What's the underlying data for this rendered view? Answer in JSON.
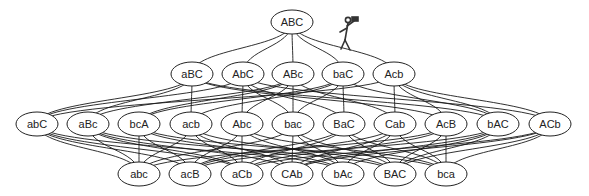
{
  "diagram": {
    "type": "lattice",
    "node_rx": 21,
    "node_ry": 12,
    "nodes": [
      {
        "id": "ABC",
        "label": "ABC",
        "x": 292,
        "y": 22
      },
      {
        "id": "aBC",
        "label": "aBC",
        "x": 192,
        "y": 74
      },
      {
        "id": "AbC",
        "label": "AbC",
        "x": 243,
        "y": 74
      },
      {
        "id": "ABc",
        "label": "ABc",
        "x": 293,
        "y": 74
      },
      {
        "id": "baC",
        "label": "baC",
        "x": 343,
        "y": 74
      },
      {
        "id": "Acb",
        "label": "Acb",
        "x": 394,
        "y": 74
      },
      {
        "id": "abC",
        "label": "abC",
        "x": 37,
        "y": 124
      },
      {
        "id": "aBc",
        "label": "aBc",
        "x": 88,
        "y": 124
      },
      {
        "id": "bcA",
        "label": "bcA",
        "x": 139,
        "y": 124
      },
      {
        "id": "acb",
        "label": "acb",
        "x": 191,
        "y": 124
      },
      {
        "id": "Abc",
        "label": "Abc",
        "x": 242,
        "y": 124
      },
      {
        "id": "bac",
        "label": "bac",
        "x": 293,
        "y": 124
      },
      {
        "id": "BaC",
        "label": "BaC",
        "x": 344,
        "y": 124
      },
      {
        "id": "Cab",
        "label": "Cab",
        "x": 395,
        "y": 124
      },
      {
        "id": "AcB",
        "label": "AcB",
        "x": 446,
        "y": 124
      },
      {
        "id": "bAC",
        "label": "bAC",
        "x": 498,
        "y": 124
      },
      {
        "id": "ACb",
        "label": "ACb",
        "x": 550,
        "y": 124
      },
      {
        "id": "abc",
        "label": "abc",
        "x": 139,
        "y": 174
      },
      {
        "id": "acB",
        "label": "acB",
        "x": 190,
        "y": 174
      },
      {
        "id": "aCb",
        "label": "aCb",
        "x": 242,
        "y": 174
      },
      {
        "id": "CAb",
        "label": "CAb",
        "x": 292,
        "y": 174
      },
      {
        "id": "bAc",
        "label": "bAc",
        "x": 343,
        "y": 174
      },
      {
        "id": "BAC",
        "label": "BAC",
        "x": 395,
        "y": 174
      },
      {
        "id": "bca",
        "label": "bca",
        "x": 446,
        "y": 174
      }
    ],
    "edges": [
      [
        "ABC",
        "aBC"
      ],
      [
        "ABC",
        "AbC"
      ],
      [
        "ABC",
        "ABc"
      ],
      [
        "ABC",
        "baC"
      ],
      [
        "ABC",
        "Acb"
      ],
      [
        "aBC",
        "abC"
      ],
      [
        "aBC",
        "aBc"
      ],
      [
        "aBC",
        "acb"
      ],
      [
        "aBC",
        "AcB"
      ],
      [
        "aBC",
        "bAC"
      ],
      [
        "AbC",
        "abC"
      ],
      [
        "AbC",
        "Abc"
      ],
      [
        "AbC",
        "bac"
      ],
      [
        "AbC",
        "BaC"
      ],
      [
        "AbC",
        "ACb"
      ],
      [
        "ABc",
        "aBc"
      ],
      [
        "ABc",
        "bcA"
      ],
      [
        "ABc",
        "Abc"
      ],
      [
        "ABc",
        "bac"
      ],
      [
        "ABc",
        "Cab"
      ],
      [
        "baC",
        "bcA"
      ],
      [
        "baC",
        "acb"
      ],
      [
        "baC",
        "bac"
      ],
      [
        "baC",
        "BaC"
      ],
      [
        "baC",
        "bAC"
      ],
      [
        "Acb",
        "abC"
      ],
      [
        "Acb",
        "Cab"
      ],
      [
        "Acb",
        "AcB"
      ],
      [
        "Acb",
        "bAC"
      ],
      [
        "Acb",
        "ACb"
      ],
      [
        "abC",
        "abc"
      ],
      [
        "abC",
        "acB"
      ],
      [
        "abC",
        "aCb"
      ],
      [
        "abC",
        "bAc"
      ],
      [
        "aBc",
        "abc"
      ],
      [
        "aBc",
        "aCb"
      ],
      [
        "aBc",
        "CAb"
      ],
      [
        "aBc",
        "BAC"
      ],
      [
        "bcA",
        "abc"
      ],
      [
        "bcA",
        "acB"
      ],
      [
        "bcA",
        "bAc"
      ],
      [
        "bcA",
        "bca"
      ],
      [
        "acb",
        "abc"
      ],
      [
        "acb",
        "aCb"
      ],
      [
        "acb",
        "CAb"
      ],
      [
        "acb",
        "BAC"
      ],
      [
        "Abc",
        "acB"
      ],
      [
        "Abc",
        "aCb"
      ],
      [
        "Abc",
        "bAc"
      ],
      [
        "Abc",
        "bca"
      ],
      [
        "bac",
        "abc"
      ],
      [
        "bac",
        "CAb"
      ],
      [
        "bac",
        "bAc"
      ],
      [
        "bac",
        "BAC"
      ],
      [
        "BaC",
        "acB"
      ],
      [
        "BaC",
        "aCb"
      ],
      [
        "BaC",
        "BAC"
      ],
      [
        "BaC",
        "bca"
      ],
      [
        "Cab",
        "acB"
      ],
      [
        "Cab",
        "CAb"
      ],
      [
        "Cab",
        "bAc"
      ],
      [
        "Cab",
        "bca"
      ],
      [
        "AcB",
        "abc"
      ],
      [
        "AcB",
        "aCb"
      ],
      [
        "AcB",
        "BAC"
      ],
      [
        "AcB",
        "bca"
      ],
      [
        "bAC",
        "acB"
      ],
      [
        "bAC",
        "CAb"
      ],
      [
        "bAC",
        "bAc"
      ],
      [
        "bAC",
        "BAC"
      ],
      [
        "ACb",
        "aCb"
      ],
      [
        "ACb",
        "CAb"
      ],
      [
        "ACb",
        "BAC"
      ],
      [
        "ACb",
        "bca"
      ]
    ],
    "figure": {
      "name": "stick-figure-with-binoculars",
      "x": 348,
      "y": 34
    }
  }
}
